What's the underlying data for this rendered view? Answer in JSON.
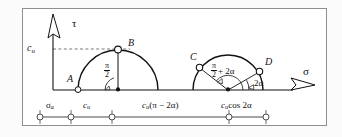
{
  "figure": {
    "type": "mohr-circle-diagram",
    "axes": {
      "vertical_label": "τ",
      "horizontal_label": "σ",
      "vertical_tick_label": "c",
      "vertical_tick_sub": "u"
    },
    "points": [
      {
        "id": "A",
        "label": "A",
        "circle": 1,
        "position": "left-on-axis"
      },
      {
        "id": "B",
        "label": "B",
        "circle": 1,
        "position": "apex"
      },
      {
        "id": "C",
        "label": "C",
        "circle": 2,
        "position": "upper-left"
      },
      {
        "id": "D",
        "label": "D",
        "circle": 2,
        "position": "upper-right"
      }
    ],
    "angles": [
      {
        "id": "angle-pi-over-2",
        "num": "π",
        "den": "2",
        "suffix": "",
        "circle": 1
      },
      {
        "id": "angle-pi-over-2-plus-2alpha",
        "num": "π",
        "den": "2",
        "suffix": "+ 2α",
        "circle": 2
      },
      {
        "id": "angle-2alpha",
        "label": "2α",
        "circle": 2
      }
    ],
    "dimensions": [
      {
        "id": "sigma-a",
        "main": "σ",
        "sub": "a",
        "tail": ""
      },
      {
        "id": "c-u",
        "main": "c",
        "sub": "u",
        "tail": ""
      },
      {
        "id": "c-u-pi-minus-2alpha",
        "main": "c",
        "sub": "u",
        "tail": "(π − 2α)"
      },
      {
        "id": "c-u-cos-2alpha",
        "main": "c",
        "sub": "u",
        "tail": "cos 2α"
      }
    ],
    "colors": {
      "stroke": "#111111",
      "frame": "#8d8d92",
      "dashed": "#555555",
      "background": "#ffffff"
    }
  }
}
